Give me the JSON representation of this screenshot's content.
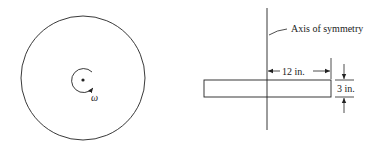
{
  "left_view": {
    "omega_label": "ω"
  },
  "right_view": {
    "axis_label": "Axis of symmetry",
    "radius_label": "12 in.",
    "thickness_label": "3 in."
  },
  "colors": {
    "line": "#222222",
    "background": "#ffffff"
  }
}
